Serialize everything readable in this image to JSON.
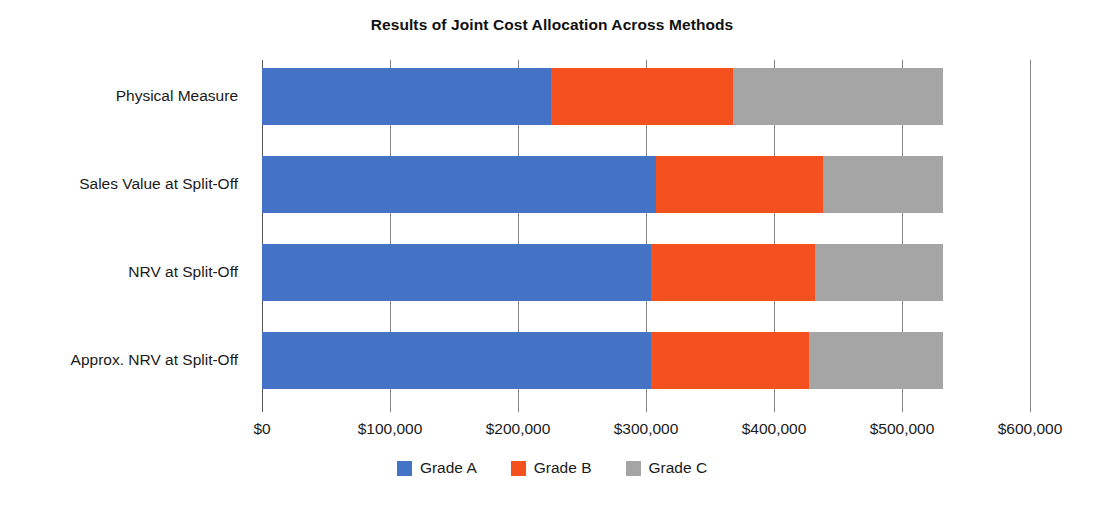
{
  "chart_data": {
    "type": "bar",
    "orientation": "horizontal",
    "stacked": true,
    "title": "Results of Joint Cost Allocation Across Methods",
    "xlabel": "",
    "ylabel": "",
    "xlim": [
      0,
      600000
    ],
    "grid": true,
    "legend_position": "bottom",
    "categories": [
      "Physical Measure",
      "Sales Value at Split-Off",
      "NRV at Split-Off",
      "Approx. NRV at Split-Off"
    ],
    "series": [
      {
        "name": "Grade A",
        "color": "#4472C4",
        "values": [
          226000,
          308000,
          304000,
          304000
        ]
      },
      {
        "name": "Grade B",
        "color": "#F4511E",
        "values": [
          142000,
          130000,
          128000,
          123000
        ]
      },
      {
        "name": "Grade C",
        "color": "#A5A5A5",
        "values": [
          164000,
          94000,
          100000,
          105000
        ]
      }
    ],
    "totals": [
      532000,
      532000,
      532000,
      532000
    ],
    "xticks": [
      0,
      100000,
      200000,
      300000,
      400000,
      500000,
      600000
    ],
    "xtick_labels": [
      "$0",
      "$100,000",
      "$200,000",
      "$300,000",
      "$400,000",
      "$500,000",
      "$600,000"
    ]
  },
  "legend": {
    "items": [
      {
        "label": "Grade A",
        "color": "#4472C4"
      },
      {
        "label": "Grade B",
        "color": "#F4511E"
      },
      {
        "label": "Grade C",
        "color": "#A5A5A5"
      }
    ]
  }
}
